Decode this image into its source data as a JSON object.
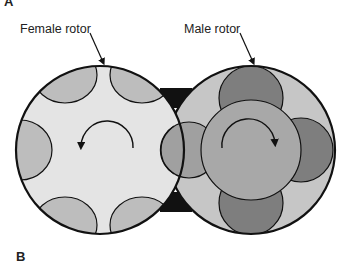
{
  "panels": {
    "top": "A",
    "bottom": "B"
  },
  "labels": {
    "female": "Female rotor",
    "male": "Male rotor"
  },
  "colors": {
    "outline": "#111111",
    "housing": "#111111",
    "female_body": "#e4e4e4",
    "female_lobe": "#bdbdbd",
    "male_body": "#c6c6c6",
    "male_core": "#a8a8a8",
    "male_lobe_dark": "#7e7e7e",
    "male_lobe_mid": "#a0a0a0"
  },
  "rotation": {
    "female": "counter-clockwise",
    "male": "clockwise"
  }
}
